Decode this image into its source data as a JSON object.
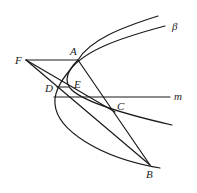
{
  "diagram": {
    "type": "geometry",
    "points": {
      "F": {
        "label": "F",
        "x": 26,
        "y": 60
      },
      "A": {
        "label": "A",
        "x": 78,
        "y": 60
      },
      "D": {
        "label": "D",
        "x": 57,
        "y": 87
      },
      "E": {
        "label": "E",
        "x": 69,
        "y": 87
      },
      "C": {
        "label": "C",
        "x": 115,
        "y": 112
      },
      "B": {
        "label": "B",
        "x": 150,
        "y": 165
      }
    },
    "labels": {
      "F": "F",
      "A": "A",
      "D": "D",
      "E": "E",
      "C": "C",
      "B": "B",
      "m": "m",
      "beta": "β"
    },
    "lines": [
      {
        "name": "FA",
        "from": "F",
        "to": "A"
      },
      {
        "name": "FC",
        "from": "F",
        "to": "C"
      },
      {
        "name": "FB",
        "from": "F",
        "to": "B"
      },
      {
        "name": "AB",
        "from": "A",
        "to": "B"
      },
      {
        "name": "DE",
        "from": "D",
        "to": "E"
      },
      {
        "name": "line-m",
        "label": "m"
      }
    ],
    "curves": [
      {
        "name": "parabola-beta",
        "label": "β"
      },
      {
        "name": "secondary-curve"
      }
    ]
  }
}
